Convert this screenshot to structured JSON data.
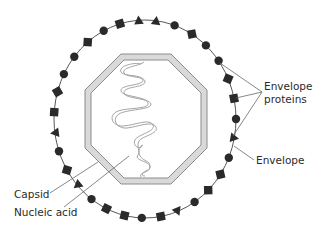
{
  "figure": {
    "type": "virus-structure-diagram"
  },
  "labels": {
    "envelope_proteins_line1": "Envelope",
    "envelope_proteins_line2": "proteins",
    "envelope": "Envelope",
    "capsid": "Capsid",
    "nucleic_acid": "Nucleic acid"
  },
  "colors": {
    "marker_fill": "#2a2a2a",
    "envelope_line": "#444444",
    "capsid_fill": "#d9d9d9",
    "capsid_stroke": "#8c8c8c",
    "nucleic_acid_stroke": "#9a9a9a",
    "leader_line": "#6a6a6a",
    "text": "#2b2b2b"
  },
  "envelope_proteins": {
    "shape_types": [
      "circle",
      "square",
      "diamond",
      "triangle"
    ],
    "sequence_clockwise_from_top": [
      {
        "shape": "square",
        "angle_deg": -106
      },
      {
        "shape": "triangle",
        "angle_deg": -94
      },
      {
        "shape": "triangle",
        "angle_deg": -83
      },
      {
        "shape": "circle",
        "angle_deg": -71
      },
      {
        "shape": "diamond",
        "angle_deg": -59
      },
      {
        "shape": "circle",
        "angle_deg": -48
      },
      {
        "shape": "circle",
        "angle_deg": -36
      },
      {
        "shape": "diamond",
        "angle_deg": -24
      },
      {
        "shape": "square",
        "angle_deg": -12
      },
      {
        "shape": "circle",
        "angle_deg": 0
      },
      {
        "shape": "triangle",
        "angle_deg": 11
      },
      {
        "shape": "circle",
        "angle_deg": 23
      },
      {
        "shape": "diamond",
        "angle_deg": 34
      },
      {
        "shape": "diamond",
        "angle_deg": 46
      },
      {
        "shape": "circle",
        "angle_deg": 57
      },
      {
        "shape": "triangle",
        "angle_deg": 69
      },
      {
        "shape": "square",
        "angle_deg": 80
      },
      {
        "shape": "circle",
        "angle_deg": 92
      },
      {
        "shape": "square",
        "angle_deg": 103
      },
      {
        "shape": "square",
        "angle_deg": 115
      },
      {
        "shape": "circle",
        "angle_deg": 126
      },
      {
        "shape": "triangle",
        "angle_deg": 138
      },
      {
        "shape": "diamond",
        "angle_deg": 149
      },
      {
        "shape": "circle",
        "angle_deg": 161
      },
      {
        "shape": "triangle",
        "angle_deg": 172
      },
      {
        "shape": "square",
        "angle_deg": 184
      },
      {
        "shape": "diamond",
        "angle_deg": 196
      },
      {
        "shape": "circle",
        "angle_deg": 207
      },
      {
        "shape": "circle",
        "angle_deg": 219
      },
      {
        "shape": "diamond",
        "angle_deg": 231
      },
      {
        "shape": "circle",
        "angle_deg": 243
      }
    ],
    "pointed_to_by_label": [
      6,
      8,
      10
    ]
  }
}
